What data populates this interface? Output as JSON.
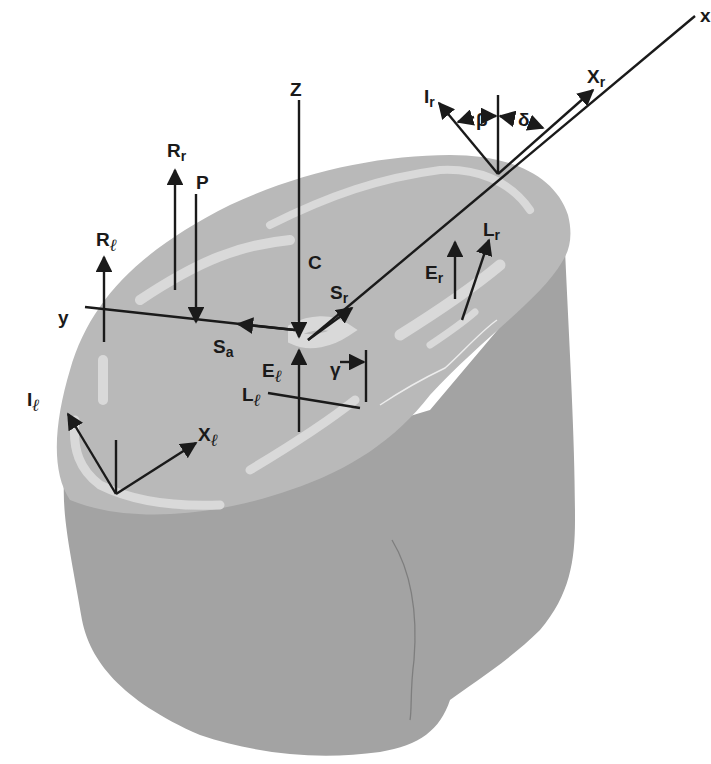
{
  "figure": {
    "type": "biomechanical-force-diagram",
    "colors": {
      "background": "#ffffff",
      "top_surface": "#b9b9b9",
      "top_highlight": "#d9d9d9",
      "body": "#a3a3a3",
      "ink": "#1a1a1a"
    },
    "axes": {
      "x": "x",
      "y": "y",
      "z": "Z"
    },
    "labels": {
      "Rr": {
        "main": "R",
        "sub": "r"
      },
      "P": {
        "main": "P"
      },
      "Rl": {
        "main": "R",
        "sub": "ℓ"
      },
      "C": {
        "main": "C"
      },
      "Sr": {
        "main": "S",
        "sub": "r"
      },
      "Sa": {
        "main": "S",
        "sub": "a"
      },
      "El": {
        "main": "E",
        "sub": "ℓ"
      },
      "Er": {
        "main": "E",
        "sub": "r"
      },
      "Lr": {
        "main": "L",
        "sub": "r"
      },
      "Ll": {
        "main": "L",
        "sub": "ℓ"
      },
      "Il": {
        "main": "I",
        "sub": "ℓ"
      },
      "Xl": {
        "main": "X",
        "sub": "ℓ"
      },
      "Ir": {
        "main": "I",
        "sub": "r"
      },
      "Xr": {
        "main": "X",
        "sub": "r"
      },
      "beta": "β",
      "delta": "δ",
      "gamma": "γ"
    }
  }
}
